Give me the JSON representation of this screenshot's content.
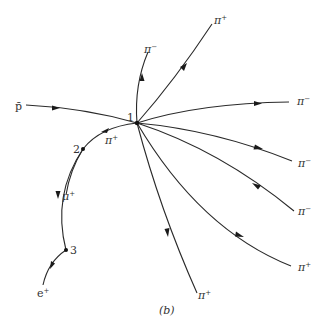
{
  "figure": {
    "caption": "(b)",
    "background": "#ffffff",
    "stroke_color": "#2a2a2a"
  },
  "vertices": [
    {
      "id": "1",
      "label": "1",
      "x": 137,
      "y": 123
    },
    {
      "id": "2",
      "label": "2",
      "x": 83,
      "y": 149
    },
    {
      "id": "3",
      "label": "3",
      "x": 66,
      "y": 250
    }
  ],
  "tracks": [
    {
      "name": "antiproton",
      "particle": "p̄",
      "base": "p̄",
      "sup": "",
      "from": "start",
      "to": "1"
    },
    {
      "name": "pi-minus-up",
      "particle": "π⁻",
      "base": "π",
      "sup": "−",
      "from": "1",
      "to": "end"
    },
    {
      "name": "pi-plus-upper-right",
      "particle": "π⁺",
      "base": "π",
      "sup": "+",
      "from": "1",
      "to": "end"
    },
    {
      "name": "pi-minus-right",
      "particle": "π⁻",
      "base": "π",
      "sup": "−",
      "from": "1",
      "to": "end"
    },
    {
      "name": "pi-minus-right-2",
      "particle": "π⁻",
      "base": "π",
      "sup": "−",
      "from": "1",
      "to": "end"
    },
    {
      "name": "pi-minus-right-3",
      "particle": "π⁻",
      "base": "π",
      "sup": "−",
      "from": "1",
      "to": "end"
    },
    {
      "name": "pi-plus-lower-right",
      "particle": "π⁺",
      "base": "π",
      "sup": "+",
      "from": "1",
      "to": "end"
    },
    {
      "name": "pi-plus-down",
      "particle": "π⁺",
      "base": "π",
      "sup": "+",
      "from": "1",
      "to": "end"
    },
    {
      "name": "pi-plus-left",
      "particle": "π⁺",
      "base": "π",
      "sup": "+",
      "from": "1",
      "to": "2"
    },
    {
      "name": "muon",
      "particle": "μ⁺",
      "base": "μ",
      "sup": "+",
      "from": "2",
      "to": "3"
    },
    {
      "name": "positron",
      "particle": "e⁺",
      "base": "e",
      "sup": "+",
      "from": "3",
      "to": "end"
    }
  ]
}
